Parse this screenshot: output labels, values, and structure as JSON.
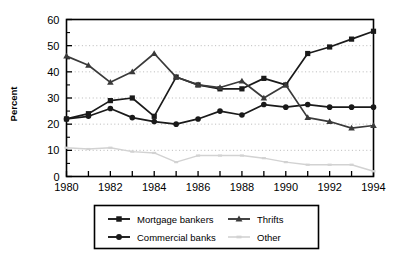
{
  "chart_data": {
    "type": "line",
    "title": "",
    "xlabel": "",
    "ylabel": "Percent",
    "xlim": [
      1980,
      1994
    ],
    "ylim": [
      0,
      60
    ],
    "ytick_step": 10,
    "yticks": [
      0,
      10,
      20,
      30,
      40,
      50,
      60
    ],
    "ytick_labels": [
      "0",
      "10",
      "20",
      "30",
      "40",
      "50",
      "60"
    ],
    "yminor_step": 5,
    "x": [
      1980,
      1981,
      1982,
      1983,
      1984,
      1985,
      1986,
      1987,
      1988,
      1989,
      1990,
      1991,
      1992,
      1993,
      1994
    ],
    "xticks": [
      1980,
      1981,
      1982,
      1983,
      1984,
      1985,
      1986,
      1987,
      1988,
      1989,
      1990,
      1991,
      1992,
      1993,
      1994
    ],
    "xtick_labels": [
      "1980",
      "",
      "1982",
      "",
      "1984",
      "",
      "1986",
      "",
      "1988",
      "",
      "1990",
      "",
      "1992",
      "",
      "1994"
    ],
    "xtick_labels_shown": [
      "1980",
      "1982",
      "1984",
      "1986",
      "1988",
      "1990",
      "1992",
      "1994"
    ],
    "grid": "horizontal-dotted",
    "legend_position": "below-plot",
    "series": [
      {
        "name": "Mortgage bankers",
        "marker": "square",
        "color": "#1a1a1a",
        "values": [
          22.0,
          24.0,
          29.0,
          30.0,
          23.0,
          38.0,
          35.0,
          33.5,
          33.5,
          37.5,
          35.0,
          47.0,
          49.5,
          52.5,
          55.5
        ]
      },
      {
        "name": "Commercial banks",
        "marker": "circle",
        "color": "#1a1a1a",
        "values": [
          22.0,
          23.0,
          26.0,
          22.5,
          21.0,
          20.0,
          22.0,
          25.0,
          23.5,
          27.5,
          26.5,
          27.5,
          26.5,
          26.5,
          26.5
        ]
      },
      {
        "name": "Thrifts",
        "marker": "triangle",
        "color": "#3a3a3a",
        "values": [
          46.0,
          42.5,
          36.0,
          40.0,
          47.0,
          38.0,
          35.0,
          34.0,
          36.5,
          30.0,
          35.0,
          22.5,
          21.0,
          18.5,
          19.5
        ]
      },
      {
        "name": "Other",
        "marker": "line",
        "color": "#d2d2d2",
        "values": [
          11.0,
          10.5,
          11.0,
          9.5,
          9.0,
          5.5,
          8.0,
          8.0,
          8.0,
          7.0,
          5.5,
          4.5,
          4.5,
          4.5,
          2.0
        ]
      }
    ]
  },
  "legend": {
    "entries": [
      {
        "label": "Mortgage bankers"
      },
      {
        "label": "Thrifts"
      },
      {
        "label": "Commercial banks"
      },
      {
        "label": "Other"
      }
    ]
  }
}
